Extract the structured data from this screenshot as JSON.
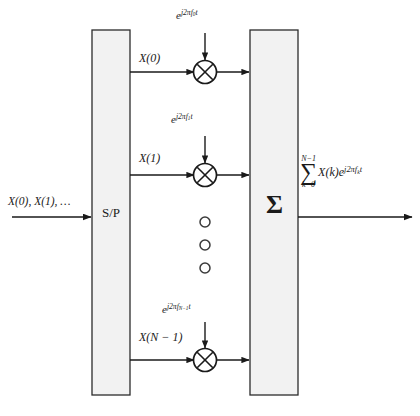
{
  "diagram": {
    "background_color": "#ffffff",
    "line_color": "#1a1a1a",
    "block_fill_color": "#f2f2f2",
    "block_border_color": "#2b2b2b",
    "input": {
      "label": "X(0), X(1), …",
      "arrow_direction": "right"
    },
    "blocks": {
      "serial_to_parallel": {
        "label": "S/P",
        "x": 92,
        "y": 30,
        "width": 38,
        "height": 365
      },
      "summer": {
        "label": "Σ",
        "x": 250,
        "y": 30,
        "width": 48,
        "height": 365
      }
    },
    "branches": [
      {
        "id": "branch-0",
        "signal_label": "X(0)",
        "carrier_label": "e^{j2πf₀t}",
        "carrier_base": "e",
        "carrier_exponent_prefix": "j2πf",
        "carrier_subscript": "0",
        "carrier_exponent_suffix": "t",
        "mixer_symbol": "multiplier-cross-circle",
        "y": 72
      },
      {
        "id": "branch-1",
        "signal_label": "X(1)",
        "carrier_label": "e^{j2πf₁t}",
        "carrier_base": "e",
        "carrier_exponent_prefix": "j2πf",
        "carrier_subscript": "1",
        "carrier_exponent_suffix": "t",
        "mixer_symbol": "multiplier-cross-circle",
        "y": 175
      },
      {
        "id": "branch-n-1",
        "signal_label": "X(N − 1)",
        "carrier_label": "e^{j2πf_{N−1}t}",
        "carrier_base": "e",
        "carrier_exponent_prefix": "j2πf",
        "carrier_subscript": "N−1",
        "carrier_exponent_suffix": "t",
        "mixer_symbol": "multiplier-cross-circle",
        "y": 360
      }
    ],
    "ellipsis": {
      "symbol": "vertical-dots",
      "count": 3,
      "circle_y_positions": [
        222,
        245,
        268
      ],
      "circle_x": 205
    },
    "output": {
      "sum_upper_limit": "N−1",
      "sum_glyph": "∑",
      "sum_lower_limit": "k=0",
      "sum_body": "X(k)e",
      "sum_body_exponent_prefix": "j2πf",
      "sum_body_subscript": "k",
      "sum_body_exponent_suffix": "t",
      "full_label": "∑_{k=0}^{N−1} X(k)e^{j2πf_k t}",
      "arrow_direction": "right"
    }
  }
}
